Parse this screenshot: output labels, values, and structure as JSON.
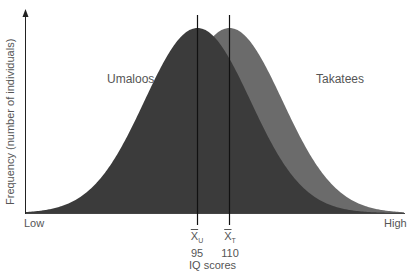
{
  "chart_data": {
    "type": "area",
    "title": "",
    "xlabel": "IQ scores",
    "ylabel": "Frequency (number of individuals)",
    "x_axis_ends": {
      "left": "Low",
      "right": "High"
    },
    "grid": false,
    "legend_position": "inline",
    "series": [
      {
        "name": "Umaloos",
        "distribution": "normal",
        "mean": 95,
        "mean_label": "X̅U",
        "color": "#3b3b3b",
        "layer": "front"
      },
      {
        "name": "Takatees",
        "distribution": "normal",
        "mean": 110,
        "mean_label": "X̅T",
        "color": "#6b6b6b",
        "layer": "back"
      }
    ],
    "annotations": [
      {
        "type": "vline",
        "x": 95,
        "label": "X̅U",
        "value_label": "95"
      },
      {
        "type": "vline",
        "x": 110,
        "label": "X̅T",
        "value_label": "110"
      }
    ],
    "equal_spread": true
  },
  "labels": {
    "umaloos": "Umaloos",
    "takatees": "Takatees",
    "low": "Low",
    "high": "High",
    "xlabel": "IQ scores",
    "ylabel": "Frequency (number of individuals)",
    "mean_u_sym": "X",
    "mean_u_sub": "U",
    "mean_u_val": "95",
    "mean_t_sym": "X",
    "mean_t_sub": "T",
    "mean_t_val": "110"
  },
  "colors": {
    "umaloos": "#3b3b3b",
    "takatees": "#6b6b6b",
    "axis": "#222222",
    "text": "#555555"
  }
}
